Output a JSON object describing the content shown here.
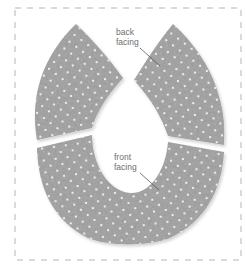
{
  "diagram": {
    "type": "sewing pattern illustration",
    "pieces": [
      {
        "id": "back-left",
        "name": "back facing (left half)"
      },
      {
        "id": "back-right",
        "name": "back facing (right half)"
      },
      {
        "id": "front",
        "name": "front facing"
      }
    ],
    "labels": {
      "back_line1": "back",
      "back_line2": "facing",
      "front_line1": "front",
      "front_line2": "facing"
    },
    "colors": {
      "fabric": "#a8a8a8",
      "fabric_dark": "#8f8f8f",
      "dots": "#ffffff",
      "border_dash": "#b5b5b5",
      "label_text": "#6e6e6e",
      "leader_line": "#5a5a5a",
      "background": "#ffffff"
    }
  }
}
